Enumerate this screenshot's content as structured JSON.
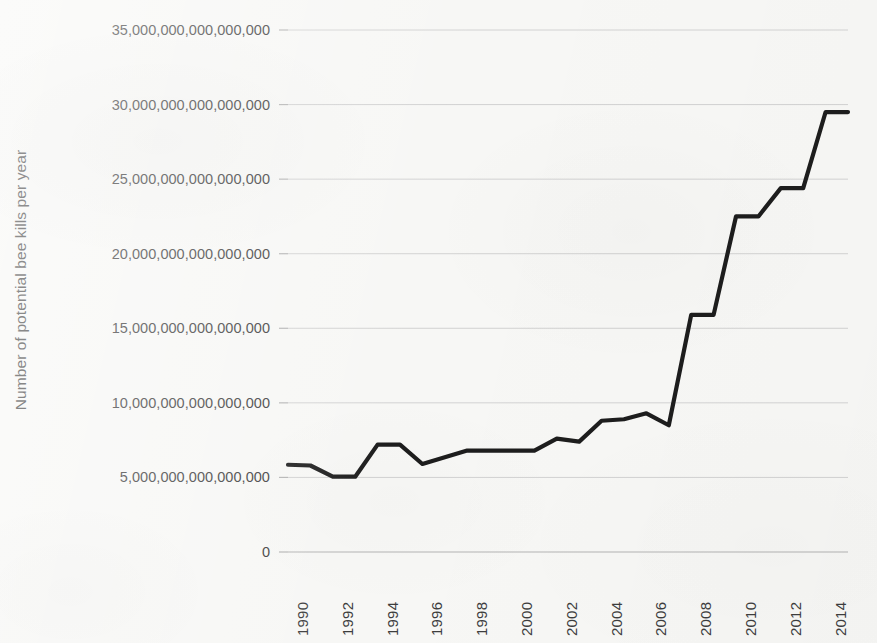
{
  "chart_data": {
    "type": "line",
    "title": "",
    "subtitle": "",
    "xlabel": "",
    "ylabel": "Number of potential bee kills per year",
    "grid": true,
    "legend": false,
    "legend_position": "none",
    "xlim": [
      1990,
      2015
    ],
    "ylim": [
      0,
      35000000000000000
    ],
    "ytick_labels": [
      "35,000,000,000,000,000",
      "30,000,000,000,000,000",
      "25,000,000,000,000,000",
      "20,000,000,000,000,000",
      "15,000,000,000,000,000",
      "10,000,000,000,000,000",
      "5,000,000,000,000,000",
      "0"
    ],
    "ytick_values": [
      35000000000000000,
      30000000000000000,
      25000000000000000,
      20000000000000000,
      15000000000000000,
      10000000000000000,
      5000000000000000,
      0
    ],
    "xtick_labels": [
      "1990",
      "1992",
      "1994",
      "1996",
      "1998",
      "2000",
      "2002",
      "2004",
      "2006",
      "2008",
      "2010",
      "2012",
      "2014"
    ],
    "xtick_values": [
      1990,
      1992,
      1994,
      1996,
      1998,
      2000,
      2002,
      2004,
      2006,
      2008,
      2010,
      2012,
      2014
    ],
    "x": [
      1990,
      1991,
      1992,
      1993,
      1994,
      1995,
      1996,
      1997,
      1998,
      1999,
      2000,
      2001,
      2002,
      2003,
      2004,
      2005,
      2006,
      2007,
      2008,
      2009,
      2010,
      2011,
      2012,
      2013,
      2014,
      2015
    ],
    "series": [
      {
        "name": "Potential bee kills",
        "color": "#1d1d1d",
        "values": [
          5850000000000000,
          5800000000000000,
          5050000000000000,
          5050000000000000,
          7200000000000000,
          7200000000000000,
          5900000000000000,
          6350000000000000,
          6800000000000000,
          6800000000000000,
          6800000000000000,
          6800000000000000,
          7600000000000000,
          7400000000000000,
          8800000000000000,
          8900000000000000,
          9300000000000000,
          8500000000000000,
          15900000000000000,
          15900000000000000,
          22500000000000000,
          22500000000000000,
          24400000000000000,
          24400000000000000,
          29500000000000000,
          29500000000000000
        ]
      }
    ],
    "colors": {
      "background": "#f7f7f5",
      "line": "#1d1d1d",
      "gridline": "#d2d2d2",
      "axis": "#b4b4b4",
      "text": "#3d3d3d"
    }
  }
}
